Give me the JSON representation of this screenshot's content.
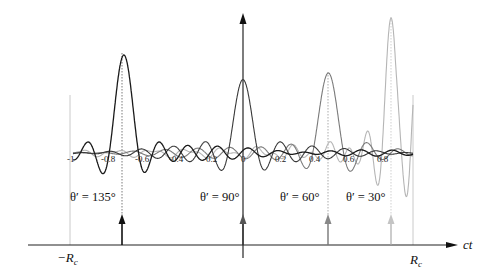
{
  "figure": {
    "type": "diagram",
    "axes": {
      "x_axis_label": "ct",
      "left_bound_label": "−R",
      "left_bound_sub": "c",
      "right_bound_label": "R",
      "right_bound_sub": "c",
      "ticks": [
        "-1",
        "-0.8",
        "-0.6",
        "-0.4",
        "-0.2",
        "0",
        "0.2",
        "0.4",
        "0.6",
        "0.8"
      ],
      "tick_values": [
        -1,
        -0.8,
        -0.6,
        -0.4,
        -0.2,
        0,
        0.2,
        0.4,
        0.6,
        0.8
      ]
    },
    "curves": [
      {
        "angle_label": "θ′ = 135°",
        "angle": 135,
        "color": "#1a1a1a",
        "peak_at": -0.7,
        "peak_height": 100
      },
      {
        "angle_label": "θ′ = 90°",
        "angle": 90,
        "color": "#3a3a3a",
        "peak_at": 0.0,
        "peak_height": 71
      },
      {
        "angle_label": "θ′ = 60°",
        "angle": 60,
        "color": "#7a7a7a",
        "peak_at": 0.5,
        "peak_height": 81
      },
      {
        "angle_label": "θ′ = 30°",
        "angle": 30,
        "color": "#b5b5b5",
        "peak_at": 0.87,
        "peak_height": 136
      }
    ]
  },
  "chart_data": {
    "type": "line",
    "title": "",
    "xlabel": "ct",
    "ylabel": "",
    "x_ticks": [
      -1,
      -0.8,
      -0.6,
      -0.4,
      -0.2,
      0,
      0.2,
      0.4,
      0.6,
      0.8
    ],
    "xlim": [
      -1,
      1
    ],
    "grid": false,
    "legend": [
      "θ′ = 135°",
      "θ′ = 90°",
      "θ′ = 60°",
      "θ′ = 30°"
    ],
    "series": [
      {
        "name": "θ′ = 135°",
        "peak_x": -0.7,
        "relative_peak": 0.74
      },
      {
        "name": "θ′ = 90°",
        "peak_x": 0.0,
        "relative_peak": 0.52
      },
      {
        "name": "θ′ = 60°",
        "peak_x": 0.5,
        "relative_peak": 0.6
      },
      {
        "name": "θ′ = 30°",
        "peak_x": 0.87,
        "relative_peak": 1.0
      }
    ]
  }
}
